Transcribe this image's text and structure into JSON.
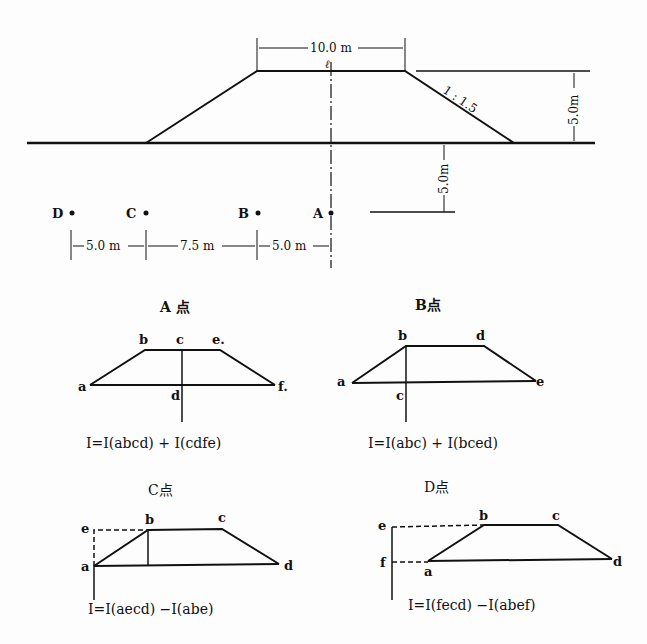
{
  "main_section": {
    "dimensions": {
      "top_width": "10.0 m",
      "height": "5.0m",
      "depth": "5.0m",
      "slope": "1 : 1.5",
      "centerline_mark": "ℓ",
      "spacing": [
        "5.0 m",
        "7.5 m",
        "5.0 m"
      ]
    },
    "points": [
      "D",
      "C",
      "B",
      "A"
    ]
  },
  "panels": [
    {
      "title": "A 点",
      "labels": {
        "a": "a",
        "b": "b",
        "c": "c",
        "d": "d",
        "e": "e.",
        "f": "f."
      },
      "equation": "I=I(abcd) + I(cdfe)"
    },
    {
      "title": "B点",
      "labels": {
        "a": "a",
        "b": "b",
        "c": "c",
        "d": "d",
        "e": "e"
      },
      "equation": "I=I(abc) + I(bced)"
    },
    {
      "title": "C点",
      "labels": {
        "a": "a",
        "b": "b",
        "c": "c",
        "d": "d",
        "e": "e"
      },
      "equation": "I=I(aecd) −I(abe)"
    },
    {
      "title": "D点",
      "labels": {
        "a": "a",
        "b": "b",
        "c": "c",
        "d": "d",
        "e": "e",
        "f": "f"
      },
      "equation": "I=I(fecd) −I(abef)"
    }
  ]
}
